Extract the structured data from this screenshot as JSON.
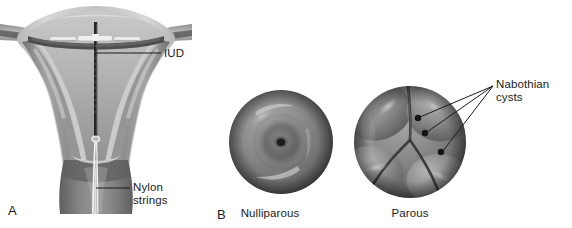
{
  "figure": {
    "background_color": "#ffffff",
    "text_color": "#1b1b1b",
    "width": 572,
    "height": 228
  },
  "panel_a": {
    "letter": "A",
    "subject": "sagittal-uterus-with-iud",
    "labels": {
      "iud": "IUD",
      "nylon_strings": "Nylon\nstrings"
    },
    "colors": {
      "myometrium": "#9b9b9b",
      "myometrium_dark": "#7d7d7d",
      "serosa_highlight": "#d2d2d2",
      "endometrium": "#8a8a8a",
      "cavity_line": "#3a3a3a",
      "cervix": "#8e8e8e",
      "cervix_dark": "#6f6f6f",
      "tube_band": "#5a5a5a",
      "iud_device": "#2a2a2a",
      "iud_arm_highlight": "#e8e8e8",
      "string": "#f2f2f2",
      "leader_line": "#1b1b1b"
    }
  },
  "panel_b": {
    "letter": "B",
    "subject": "cervical-os-comparison",
    "captions": {
      "nulliparous": "Nulliparous",
      "parous": "Parous"
    },
    "labels": {
      "nabothian_cysts": "Nabothian cysts"
    },
    "colors": {
      "cervix_base": "#8d8d8d",
      "cervix_mid": "#777777",
      "cervix_rim": "#5e5e5e",
      "cervix_highlight": "#c8c8c8",
      "os_dark": "#2e2e2e",
      "cleft": "#4a4a4a",
      "cyst_dot": "#141414",
      "leader_line": "#1b1b1b"
    },
    "nulliparous": {
      "center_x": 281,
      "center_y": 142,
      "radius": 52,
      "os_type": "small-round-central"
    },
    "parous": {
      "center_x": 410,
      "center_y": 142,
      "radius": 56,
      "os_type": "lobulated-slit",
      "cyst_count": 3,
      "cysts": [
        {
          "x": 418,
          "y": 118,
          "r": 3.2
        },
        {
          "x": 425,
          "y": 133,
          "r": 3.2
        },
        {
          "x": 441,
          "y": 152,
          "r": 3.2
        }
      ],
      "leader_converge": {
        "x": 493,
        "y": 86
      }
    }
  }
}
